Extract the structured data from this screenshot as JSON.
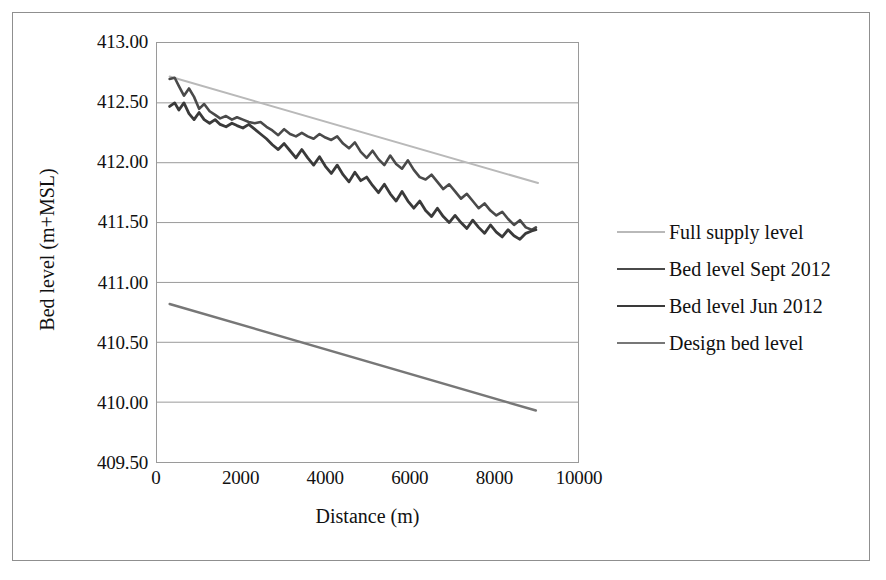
{
  "chart_data": {
    "type": "line",
    "title": "",
    "xlabel": "Distance (m)",
    "ylabel": "Bed level (m+MSL)",
    "xlim": [
      0,
      10000
    ],
    "ylim": [
      409.5,
      413.0
    ],
    "xticks": [
      "0",
      "2000",
      "4000",
      "6000",
      "8000",
      "10000"
    ],
    "xtick_values": [
      0,
      2000,
      4000,
      6000,
      8000,
      10000
    ],
    "yticks": [
      "409.50",
      "410.00",
      "410.50",
      "411.00",
      "411.50",
      "412.00",
      "412.50",
      "413.00"
    ],
    "ytick_values": [
      409.5,
      410.0,
      410.5,
      411.0,
      411.5,
      412.0,
      412.5,
      413.0
    ],
    "grid": "horizontal",
    "legend_position": "right",
    "series": [
      {
        "name": "Full supply level",
        "color": "#b9b9b9",
        "width": 2.0,
        "x": [
          300,
          9050
        ],
        "values": [
          412.72,
          411.83
        ]
      },
      {
        "name": "Bed level Sept 2012",
        "color": "#4a4a4a",
        "width": 2.6,
        "x": [
          300,
          420,
          520,
          640,
          760,
          880,
          1000,
          1120,
          1250,
          1380,
          1500,
          1640,
          1780,
          1900,
          2040,
          2180,
          2320,
          2460,
          2600,
          2740,
          2880,
          3020,
          3160,
          3300,
          3440,
          3580,
          3720,
          3860,
          4000,
          4140,
          4280,
          4420,
          4560,
          4700,
          4840,
          4980,
          5120,
          5260,
          5400,
          5540,
          5680,
          5820,
          5960,
          6100,
          6240,
          6380,
          6520,
          6660,
          6800,
          6940,
          7080,
          7220,
          7360,
          7500,
          7640,
          7780,
          7920,
          8060,
          8200,
          8340,
          8480,
          8620,
          8760,
          8900,
          9000
        ],
        "values": [
          412.7,
          412.71,
          412.64,
          412.56,
          412.62,
          412.55,
          412.45,
          412.49,
          412.43,
          412.4,
          412.37,
          412.39,
          412.36,
          412.38,
          412.36,
          412.34,
          412.33,
          412.34,
          412.3,
          412.27,
          412.23,
          412.28,
          412.24,
          412.22,
          412.25,
          412.22,
          412.2,
          412.24,
          412.21,
          412.19,
          412.22,
          412.16,
          412.12,
          412.17,
          412.09,
          412.04,
          412.1,
          412.03,
          411.98,
          412.06,
          411.99,
          411.95,
          412.02,
          411.94,
          411.88,
          411.86,
          411.9,
          411.84,
          411.78,
          411.82,
          411.76,
          411.7,
          411.74,
          411.68,
          411.62,
          411.66,
          411.6,
          411.56,
          411.59,
          411.53,
          411.48,
          411.52,
          411.46,
          411.44,
          411.46
        ]
      },
      {
        "name": "Bed level Jun 2012",
        "color": "#3a3a3a",
        "width": 2.8,
        "x": [
          300,
          420,
          520,
          640,
          760,
          880,
          1000,
          1120,
          1250,
          1380,
          1500,
          1640,
          1780,
          1900,
          2040,
          2180,
          2320,
          2460,
          2600,
          2740,
          2880,
          3020,
          3160,
          3300,
          3440,
          3580,
          3720,
          3860,
          4000,
          4140,
          4280,
          4420,
          4560,
          4700,
          4840,
          4980,
          5120,
          5260,
          5400,
          5540,
          5680,
          5820,
          5960,
          6100,
          6240,
          6380,
          6520,
          6660,
          6800,
          6940,
          7080,
          7220,
          7360,
          7500,
          7640,
          7780,
          7920,
          8060,
          8200,
          8340,
          8480,
          8620,
          8760,
          8900,
          9000
        ],
        "values": [
          412.47,
          412.5,
          412.44,
          412.5,
          412.41,
          412.36,
          412.42,
          412.36,
          412.33,
          412.36,
          412.32,
          412.3,
          412.33,
          412.31,
          412.29,
          412.32,
          412.28,
          412.24,
          412.2,
          412.15,
          412.11,
          412.16,
          412.1,
          412.04,
          412.11,
          412.04,
          411.98,
          412.05,
          411.97,
          411.91,
          411.98,
          411.9,
          411.84,
          411.92,
          411.85,
          411.88,
          411.81,
          411.75,
          411.82,
          411.74,
          411.68,
          411.76,
          411.68,
          411.62,
          411.68,
          411.6,
          411.55,
          411.62,
          411.55,
          411.5,
          411.56,
          411.5,
          411.45,
          411.52,
          411.46,
          411.41,
          411.48,
          411.42,
          411.38,
          411.44,
          411.39,
          411.36,
          411.41,
          411.43,
          411.44
        ]
      },
      {
        "name": "Design bed level",
        "color": "#777777",
        "width": 2.4,
        "x": [
          300,
          9000
        ],
        "values": [
          410.82,
          409.93
        ]
      }
    ]
  },
  "legend": {
    "items": [
      {
        "label": "Full supply level",
        "color": "#b9b9b9",
        "width": 2.0
      },
      {
        "label": "Bed level Sept 2012",
        "color": "#4a4a4a",
        "width": 2.6
      },
      {
        "label": "Bed level Jun 2012",
        "color": "#3a3a3a",
        "width": 2.8
      },
      {
        "label": "Design bed level",
        "color": "#777777",
        "width": 2.4
      }
    ]
  },
  "style": {
    "grid_color": "#9a9a9a",
    "frame_color": "#9a9a9a",
    "outer_border_color": "#8f8f8f",
    "text_color": "#111111",
    "background": "#ffffff"
  }
}
